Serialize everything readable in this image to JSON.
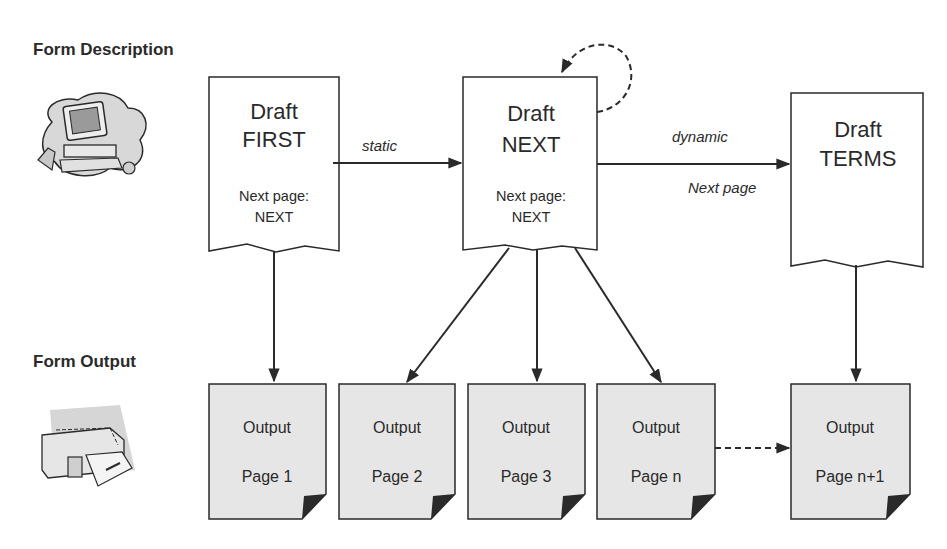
{
  "sections": {
    "description_title": "Form Description",
    "output_title": "Form Output",
    "description_icon": "computer-icon",
    "output_icon": "printer-icon"
  },
  "drafts": [
    {
      "id": "first",
      "line1": "Draft",
      "line2": "FIRST",
      "next_label": "Next page:",
      "next_value": "NEXT"
    },
    {
      "id": "next",
      "line1": "Draft",
      "line2": "NEXT",
      "next_label": "Next page:",
      "next_value": "NEXT"
    },
    {
      "id": "terms",
      "line1": "Draft",
      "line2": "TERMS"
    }
  ],
  "edges": {
    "first_to_next": "static",
    "next_to_terms_top": "dynamic",
    "next_to_terms_bottom": "Next page"
  },
  "outputs": [
    {
      "line1": "Output",
      "line2": "Page 1"
    },
    {
      "line1": "Output",
      "line2": "Page 2"
    },
    {
      "line1": "Output",
      "line2": "Page 3"
    },
    {
      "line1": "Output",
      "line2": "Page n"
    },
    {
      "line1": "Output",
      "line2": "Page n+1"
    }
  ],
  "colors": {
    "line": "#2a2a2a",
    "output_fill": "#e6e6e6",
    "draft_fill": "#ffffff"
  }
}
